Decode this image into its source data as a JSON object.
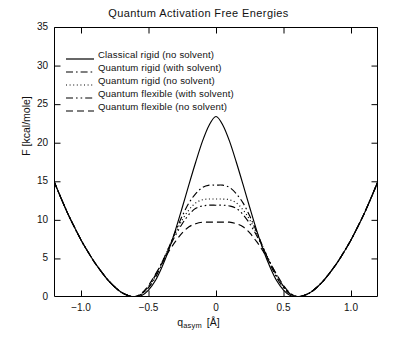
{
  "chart_data": {
    "type": "line",
    "title": "Quantum Activation Free Energies",
    "xlabel_main": "q",
    "xlabel_sub": "asym",
    "xlabel_unit": "[Å]",
    "ylabel": "F [kcal/mole]",
    "xlim": [
      -1.2,
      1.2
    ],
    "ylim": [
      0,
      35
    ],
    "xticks": [
      -1.0,
      -0.5,
      0,
      0.5,
      1.0
    ],
    "xticklabels": [
      "−1.0",
      "−0.5",
      "0",
      "0.5",
      "1.0"
    ],
    "yticks": [
      0,
      5,
      10,
      15,
      20,
      25,
      30,
      35
    ],
    "yticklabels": [
      "0",
      "5",
      "10",
      "15",
      "20",
      "25",
      "30",
      "35"
    ],
    "grid": false,
    "legend_position": "upper left",
    "series": [
      {
        "name": "Classical rigid (no solvent)",
        "style": "solid",
        "barrier": 23.4,
        "well_position": 0.7,
        "edge_value": 15.0,
        "x": [
          -1.2,
          -1.15,
          -1.1,
          -1.05,
          -1.0,
          -0.95,
          -0.9,
          -0.85,
          -0.8,
          -0.75,
          -0.7,
          -0.65,
          -0.6,
          -0.55,
          -0.5,
          -0.45,
          -0.4,
          -0.35,
          -0.3,
          -0.25,
          -0.2,
          -0.15,
          -0.1,
          -0.05,
          0,
          0.05,
          0.1,
          0.15,
          0.2,
          0.25,
          0.3,
          0.35,
          0.4,
          0.45,
          0.5,
          0.55,
          0.6,
          0.65,
          0.7,
          0.75,
          0.8,
          0.85,
          0.9,
          0.95,
          1.0,
          1.05,
          1.1,
          1.15,
          1.2
        ],
        "y": [
          15.0,
          12.9,
          10.9,
          9.1,
          7.4,
          5.9,
          4.5,
          3.3,
          2.2,
          1.3,
          0.6,
          0.2,
          0.0,
          0.2,
          0.9,
          2.1,
          3.9,
          6.1,
          8.7,
          11.6,
          14.6,
          17.5,
          20.2,
          22.3,
          23.4,
          22.3,
          20.2,
          17.5,
          14.6,
          11.6,
          8.7,
          6.1,
          3.9,
          2.1,
          0.9,
          0.2,
          0.0,
          0.2,
          0.6,
          1.3,
          2.2,
          3.3,
          4.5,
          5.9,
          7.4,
          9.1,
          10.9,
          12.9,
          15.0
        ]
      },
      {
        "name": "Quantum rigid (with solvent)",
        "style": "dashdot",
        "barrier": 14.5,
        "well_position": 0.7,
        "edge_value": 15.0,
        "x": [
          -1.2,
          -1.15,
          -1.1,
          -1.05,
          -1.0,
          -0.95,
          -0.9,
          -0.85,
          -0.8,
          -0.75,
          -0.7,
          -0.65,
          -0.6,
          -0.55,
          -0.5,
          -0.45,
          -0.4,
          -0.35,
          -0.3,
          -0.25,
          -0.2,
          -0.15,
          -0.1,
          -0.05,
          0,
          0.05,
          0.1,
          0.15,
          0.2,
          0.25,
          0.3,
          0.35,
          0.4,
          0.45,
          0.5,
          0.55,
          0.6,
          0.65,
          0.7,
          0.75,
          0.8,
          0.85,
          0.9,
          0.95,
          1.0,
          1.05,
          1.1,
          1.15,
          1.2
        ],
        "y": [
          15.0,
          12.9,
          10.9,
          9.1,
          7.4,
          5.9,
          4.5,
          3.3,
          2.2,
          1.3,
          0.6,
          0.2,
          0.05,
          0.4,
          1.2,
          2.5,
          4.3,
          6.4,
          8.5,
          10.5,
          12.2,
          13.4,
          14.2,
          14.5,
          14.5,
          14.5,
          14.2,
          13.4,
          12.2,
          10.5,
          8.5,
          6.4,
          4.3,
          2.5,
          1.2,
          0.4,
          0.05,
          0.2,
          0.6,
          1.3,
          2.2,
          3.3,
          4.5,
          5.9,
          7.4,
          9.1,
          10.9,
          12.9,
          15.0
        ]
      },
      {
        "name": "Quantum rigid (no solvent)",
        "style": "dotted",
        "barrier": 12.7,
        "well_position": 0.7,
        "edge_value": 15.0,
        "x": [
          -1.2,
          -1.15,
          -1.1,
          -1.05,
          -1.0,
          -0.95,
          -0.9,
          -0.85,
          -0.8,
          -0.75,
          -0.7,
          -0.65,
          -0.6,
          -0.55,
          -0.5,
          -0.45,
          -0.4,
          -0.35,
          -0.3,
          -0.25,
          -0.2,
          -0.15,
          -0.1,
          -0.05,
          0,
          0.05,
          0.1,
          0.15,
          0.2,
          0.25,
          0.3,
          0.35,
          0.4,
          0.45,
          0.5,
          0.55,
          0.6,
          0.65,
          0.7,
          0.75,
          0.8,
          0.85,
          0.9,
          0.95,
          1.0,
          1.05,
          1.1,
          1.15,
          1.2
        ],
        "y": [
          15.0,
          12.9,
          10.9,
          9.1,
          7.4,
          5.9,
          4.5,
          3.3,
          2.2,
          1.3,
          0.6,
          0.2,
          0.05,
          0.4,
          1.3,
          2.7,
          4.5,
          6.4,
          8.3,
          10.0,
          11.3,
          12.2,
          12.6,
          12.7,
          12.7,
          12.7,
          12.6,
          12.2,
          11.3,
          10.0,
          8.3,
          6.4,
          4.5,
          2.7,
          1.3,
          0.4,
          0.05,
          0.2,
          0.6,
          1.3,
          2.2,
          3.3,
          4.5,
          5.9,
          7.4,
          9.1,
          10.9,
          12.9,
          15.0
        ]
      },
      {
        "name": "Quantum flexible (with solvent)",
        "style": "dashdotdot",
        "barrier": 11.9,
        "well_position": 0.7,
        "edge_value": 15.0,
        "x": [
          -1.2,
          -1.15,
          -1.1,
          -1.05,
          -1.0,
          -0.95,
          -0.9,
          -0.85,
          -0.8,
          -0.75,
          -0.7,
          -0.65,
          -0.6,
          -0.55,
          -0.5,
          -0.45,
          -0.4,
          -0.35,
          -0.3,
          -0.25,
          -0.2,
          -0.15,
          -0.1,
          -0.05,
          0,
          0.05,
          0.1,
          0.15,
          0.2,
          0.25,
          0.3,
          0.35,
          0.4,
          0.45,
          0.5,
          0.55,
          0.6,
          0.65,
          0.7,
          0.75,
          0.8,
          0.85,
          0.9,
          0.95,
          1.0,
          1.05,
          1.1,
          1.15,
          1.2
        ],
        "y": [
          15.0,
          12.9,
          10.9,
          9.1,
          7.4,
          5.9,
          4.5,
          3.3,
          2.2,
          1.3,
          0.6,
          0.2,
          0.05,
          0.45,
          1.4,
          2.8,
          4.5,
          6.3,
          8.0,
          9.5,
          10.7,
          11.5,
          11.8,
          11.9,
          11.9,
          11.9,
          11.8,
          11.5,
          10.7,
          9.5,
          8.0,
          6.3,
          4.5,
          2.8,
          1.4,
          0.45,
          0.05,
          0.2,
          0.6,
          1.3,
          2.2,
          3.3,
          4.5,
          5.9,
          7.4,
          9.1,
          10.9,
          12.9,
          15.0
        ]
      },
      {
        "name": "Quantum flexible (no solvent)",
        "style": "dashed",
        "barrier": 9.7,
        "well_position": 0.7,
        "edge_value": 15.0,
        "x": [
          -1.2,
          -1.15,
          -1.1,
          -1.05,
          -1.0,
          -0.95,
          -0.9,
          -0.85,
          -0.8,
          -0.75,
          -0.7,
          -0.65,
          -0.6,
          -0.55,
          -0.5,
          -0.45,
          -0.4,
          -0.35,
          -0.3,
          -0.25,
          -0.2,
          -0.15,
          -0.1,
          -0.05,
          0,
          0.05,
          0.1,
          0.15,
          0.2,
          0.25,
          0.3,
          0.35,
          0.4,
          0.45,
          0.5,
          0.55,
          0.6,
          0.65,
          0.7,
          0.75,
          0.8,
          0.85,
          0.9,
          0.95,
          1.0,
          1.05,
          1.1,
          1.15,
          1.2
        ],
        "y": [
          15.0,
          12.9,
          10.9,
          9.1,
          7.4,
          5.9,
          4.5,
          3.3,
          2.2,
          1.3,
          0.6,
          0.2,
          0.05,
          0.5,
          1.5,
          2.9,
          4.4,
          5.9,
          7.2,
          8.3,
          9.1,
          9.5,
          9.7,
          9.7,
          9.7,
          9.7,
          9.7,
          9.5,
          9.1,
          8.3,
          7.2,
          5.9,
          4.4,
          2.9,
          1.5,
          0.5,
          0.05,
          0.2,
          0.6,
          1.3,
          2.2,
          3.3,
          4.5,
          5.9,
          7.4,
          9.1,
          10.9,
          12.9,
          15.0
        ]
      }
    ]
  },
  "legend": {
    "items": [
      {
        "label": "Classical rigid  (no solvent)",
        "style": "solid"
      },
      {
        "label": "Quantum rigid  (with solvent)",
        "style": "dashdot"
      },
      {
        "label": "Quantum rigid  (no solvent)",
        "style": "dotted"
      },
      {
        "label": "Quantum flexible  (with solvent)",
        "style": "dashdotdot"
      },
      {
        "label": "Quantum flexible  (no solvent)",
        "style": "dashed"
      }
    ]
  },
  "colors": {
    "line": "#000000",
    "axis": "#000000",
    "background": "#ffffff"
  }
}
